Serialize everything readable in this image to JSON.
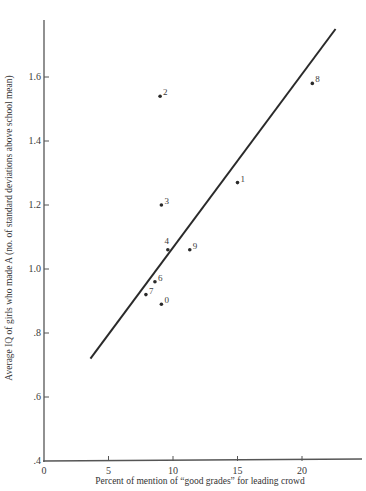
{
  "chart_data": {
    "type": "scatter",
    "title": "",
    "xlabel": "Percent of mention of “good grades” for leading crowd",
    "ylabel": "Average IQ of girls who made A (no. of standard deviations above school mean)",
    "xlim": [
      0,
      24.5
    ],
    "ylim": [
      0.4,
      1.8
    ],
    "x_ticks": [
      0,
      5,
      10,
      15,
      20
    ],
    "x_tick_labels": [
      "0",
      "5",
      "10",
      "15",
      "20"
    ],
    "y_ticks": [
      0.4,
      0.6,
      0.8,
      1.0,
      1.2,
      1.4,
      1.6
    ],
    "y_tick_labels": [
      ".4",
      ".6",
      ".8",
      "1.0",
      "1.2",
      "1.4",
      "1.6"
    ],
    "grid": false,
    "legend": null,
    "points": [
      {
        "label": "0",
        "x": 9.1,
        "y": 0.89
      },
      {
        "label": "1",
        "x": 15.0,
        "y": 1.27
      },
      {
        "label": "2",
        "x": 9.0,
        "y": 1.54
      },
      {
        "label": "3",
        "x": 9.1,
        "y": 1.2
      },
      {
        "label": "4",
        "x": 9.6,
        "y": 1.06
      },
      {
        "label": "6",
        "x": 8.6,
        "y": 0.96
      },
      {
        "label": "7",
        "x": 7.9,
        "y": 0.92
      },
      {
        "label": "8",
        "x": 20.8,
        "y": 1.58
      },
      {
        "label": "9",
        "x": 11.3,
        "y": 1.06
      }
    ],
    "fit_line": {
      "x1": 3.6,
      "y1": 0.72,
      "x2": 22.6,
      "y2": 1.75
    }
  },
  "colors": {
    "ink": "#2a2a2a",
    "axis": "#555555",
    "background": "#ffffff"
  }
}
